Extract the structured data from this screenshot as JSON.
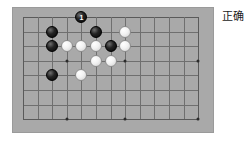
{
  "caption": {
    "text": "正确"
  },
  "board": {
    "name": "go-board",
    "cols": 13,
    "rows": 8,
    "background_color": "#a9a9a9",
    "line_color": "#6f6f6f",
    "origin_x": 10,
    "origin_y": 9,
    "cell_w": 14.6,
    "cell_h": 14.6,
    "hoshi": [
      {
        "col": 3,
        "row": 3
      },
      {
        "col": 3,
        "row": 7
      },
      {
        "col": 7,
        "row": 3
      },
      {
        "col": 7,
        "row": 7
      },
      {
        "col": 12,
        "row": 3
      },
      {
        "col": 12,
        "row": 7
      }
    ],
    "stones": [
      {
        "col": 4,
        "row": 0,
        "color": "black",
        "label": "1",
        "name": "stone-black-move-1"
      },
      {
        "col": 2,
        "row": 1,
        "color": "black",
        "label": "",
        "name": "stone-black"
      },
      {
        "col": 5,
        "row": 1,
        "color": "black",
        "label": "",
        "name": "stone-black"
      },
      {
        "col": 7,
        "row": 1,
        "color": "white",
        "label": "",
        "name": "stone-white"
      },
      {
        "col": 2,
        "row": 2,
        "color": "black",
        "label": "",
        "name": "stone-black"
      },
      {
        "col": 3,
        "row": 2,
        "color": "white",
        "label": "",
        "name": "stone-white"
      },
      {
        "col": 4,
        "row": 2,
        "color": "white",
        "label": "",
        "name": "stone-white"
      },
      {
        "col": 5,
        "row": 2,
        "color": "white",
        "label": "",
        "name": "stone-white"
      },
      {
        "col": 6,
        "row": 2,
        "color": "black",
        "label": "",
        "name": "stone-black"
      },
      {
        "col": 7,
        "row": 2,
        "color": "white",
        "label": "",
        "name": "stone-white"
      },
      {
        "col": 6,
        "row": 3,
        "color": "white",
        "label": "",
        "name": "stone-white"
      },
      {
        "col": 5,
        "row": 3,
        "color": "white",
        "label": "",
        "name": "stone-white"
      },
      {
        "col": 2,
        "row": 4,
        "color": "black",
        "label": "",
        "name": "stone-black"
      },
      {
        "col": 4,
        "row": 4,
        "color": "white",
        "label": "",
        "name": "stone-white"
      }
    ]
  }
}
